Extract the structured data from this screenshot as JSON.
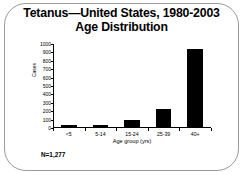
{
  "slide": {
    "title_lines": [
      "Tetanus—United States, 1980-2003",
      "Age Distribution"
    ],
    "note": "N=1,277",
    "frame_color": "#9a9a9a",
    "background_color": "#ffffff"
  },
  "chart_data": {
    "type": "bar",
    "title": "Tetanus—United States, 1980-2003 Age Distribution",
    "subtitle": "Age Distribution",
    "categories": [
      "<5",
      "5-14",
      "15-24",
      "25-39",
      "40+"
    ],
    "values": [
      28,
      27,
      85,
      215,
      930
    ],
    "series": [
      {
        "name": "Cases",
        "values": [
          28,
          27,
          85,
          215,
          930
        ]
      }
    ],
    "xlabel": "Age group (yrs)",
    "ylabel": "Cases",
    "ylim": [
      0,
      1000
    ],
    "ytick_values": [
      0,
      100,
      200,
      300,
      400,
      500,
      600,
      700,
      800,
      900,
      1000
    ],
    "ytick_labels": [
      "0",
      "100",
      "200",
      "300",
      "400",
      "500",
      "600",
      "700",
      "800",
      "900",
      "1000"
    ],
    "grid": false,
    "legend": false,
    "bar_color": "#000000",
    "annotation": "N=1,277",
    "total": 1277
  }
}
